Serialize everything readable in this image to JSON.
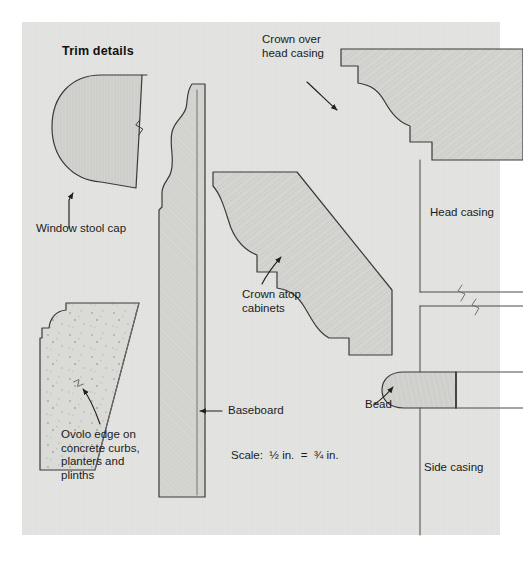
{
  "page": {
    "title": "Trim details",
    "background_color": "#ffffff",
    "panel_color": "#e4e4e2",
    "ink_color": "#2b2b2b",
    "wood_fill_color": "#d2d2cf",
    "concrete_fill_color": "#d8d8d5"
  },
  "labels": {
    "window_stool_cap": "Window stool cap",
    "ovolo_edge": "Ovolo edge on\nconcrete curbs,\nplanters and\nplinths",
    "baseboard": "Baseboard",
    "scale": "Scale:  ½ in.  =  ¾ in.",
    "crown_atop_cabinets": "Crown atop\ncabinets",
    "crown_over_head_casing": "Crown over\nhead casing",
    "head_casing": "Head casing",
    "bead": "Bead",
    "side_casing": "Side casing"
  },
  "figures": [
    {
      "id": "window-stool-cap",
      "label": "Window stool cap",
      "kind": "bullnose-profile",
      "has_break_line": true
    },
    {
      "id": "ovolo-edge",
      "label": "Ovolo edge on concrete curbs, planters and plinths",
      "kind": "ovolo-profile",
      "has_break_line": true
    },
    {
      "id": "baseboard",
      "label": "Baseboard",
      "kind": "ogee-baseboard-profile",
      "has_break_line": false
    },
    {
      "id": "crown-atop-cabinets",
      "label": "Crown atop cabinets",
      "kind": "crown-profile",
      "has_break_line": false
    },
    {
      "id": "crown-over-head-casing",
      "label": "Crown over head casing",
      "kind": "crown-profile",
      "has_break_line": false
    },
    {
      "id": "head-casing",
      "label": "Head casing",
      "kind": "casing-elevation",
      "has_break_line": true
    },
    {
      "id": "bead",
      "label": "Bead",
      "kind": "bead-profile",
      "has_break_line": false
    },
    {
      "id": "side-casing",
      "label": "Side casing",
      "kind": "casing-elevation",
      "has_break_line": false
    }
  ]
}
